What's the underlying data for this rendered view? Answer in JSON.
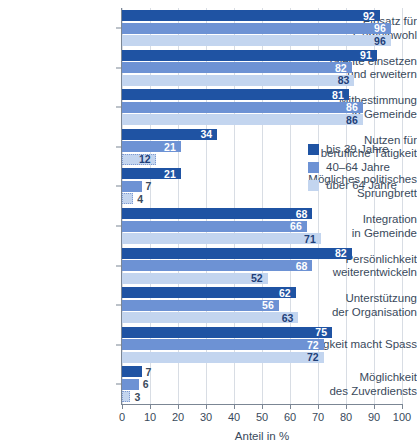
{
  "chart_data": {
    "type": "bar",
    "orientation": "horizontal",
    "title": "",
    "xlabel": "Anteil in %",
    "ylabel": "",
    "xlim": [
      0,
      100
    ],
    "xticks": [
      0,
      10,
      20,
      30,
      40,
      50,
      60,
      70,
      80,
      90,
      100
    ],
    "grid": true,
    "legend_position": "middle-right",
    "categories": [
      "Einsatz für Gemeinwohl",
      "Talente einsetzen\nund erweitern",
      "Mitbestimmung\nin Gemeinde",
      "Nutzen für\nberufliche Tätigkeit",
      "Mögliches politisches\nSprungbrett",
      "Integration\nin Gemeinde",
      "Persönlichkeit\nweiterentwickeln",
      "Unterstützung\nder Organisation",
      "Tätigkeit macht Spass",
      "Möglichkeit\ndes Zuverdiensts"
    ],
    "series": [
      {
        "name": "bis 39 Jahre",
        "color": "#1f53a3",
        "values": [
          92,
          91,
          81,
          34,
          21,
          68,
          82,
          62,
          75,
          7
        ]
      },
      {
        "name": "40–64 Jahre",
        "color": "#6d92d4",
        "values": [
          96,
          82,
          86,
          21,
          7,
          66,
          68,
          56,
          72,
          6
        ]
      },
      {
        "name": "über 64 Jahre",
        "color": "#c3d5ef",
        "values": [
          96,
          83,
          86,
          12,
          4,
          71,
          52,
          63,
          72,
          3
        ]
      }
    ]
  },
  "axis": {
    "x_title": "Anteil in %",
    "tick_labels": [
      "0",
      "10",
      "20",
      "30",
      "40",
      "50",
      "60",
      "70",
      "80",
      "90",
      "100"
    ]
  },
  "legend": {
    "items": [
      {
        "label": "bis 39 Jahre",
        "color": "#1f53a3"
      },
      {
        "label": "40–64 Jahre",
        "color": "#6d92d4"
      },
      {
        "label": "über 64 Jahre",
        "color": "#c3d5ef"
      }
    ]
  }
}
